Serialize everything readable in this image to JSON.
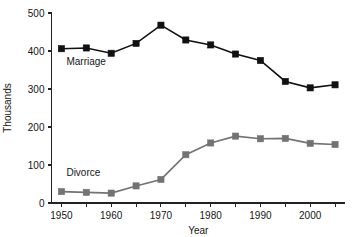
{
  "chart_data": {
    "type": "line",
    "title": "",
    "xlabel": "Year",
    "ylabel": "Thousands",
    "x": [
      1950,
      1955,
      1960,
      1965,
      1970,
      1975,
      1980,
      1985,
      1990,
      1995,
      2000,
      2005
    ],
    "xlim": [
      1948,
      2007
    ],
    "ylim": [
      0,
      500
    ],
    "xticks": [
      1950,
      1955,
      1960,
      1965,
      1970,
      1975,
      1980,
      1985,
      1990,
      1995,
      2000,
      2005
    ],
    "xtick_labels": [
      "1950",
      "",
      "1960",
      "",
      "1970",
      "",
      "1980",
      "",
      "1990",
      "",
      "2000",
      ""
    ],
    "yticks": [
      0,
      100,
      200,
      300,
      400,
      500
    ],
    "ytick_labels": [
      "0",
      "100",
      "200",
      "300",
      "400",
      "500"
    ],
    "grid": false,
    "legend_position": "inline-annotation",
    "series": [
      {
        "name": "Marriage",
        "color": "#111111",
        "marker": "square",
        "label_x": 1951,
        "label_y": 362,
        "values": [
          406,
          408,
          394,
          420,
          468,
          429,
          416,
          392,
          375,
          320,
          303,
          311
        ]
      },
      {
        "name": "Divorce",
        "color": "#737373",
        "marker": "square",
        "label_x": 1951,
        "label_y": 72,
        "values": [
          30,
          28,
          26,
          45,
          62,
          127,
          158,
          176,
          169,
          170,
          157,
          154
        ]
      }
    ]
  },
  "colors": {
    "background": "#ffffff",
    "axis": "#222222",
    "text": "#161616",
    "marriage": "#111111",
    "divorce": "#737373"
  }
}
